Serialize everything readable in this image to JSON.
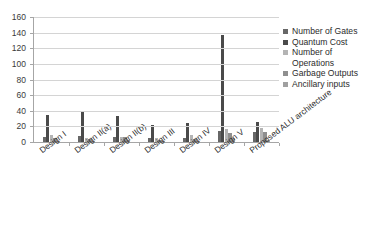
{
  "chart_data": {
    "type": "bar",
    "title": "",
    "xlabel": "",
    "ylabel": "",
    "ylim": [
      0,
      160
    ],
    "ytick_step": 20,
    "yticks": [
      0,
      20,
      40,
      60,
      80,
      100,
      120,
      140,
      160
    ],
    "grid": true,
    "legend_position": "right",
    "categories": [
      "Design I",
      "Design II(a)",
      "Design II(b)",
      "Design III",
      "Design IV",
      "Design V",
      "Proposed ALU architecture"
    ],
    "series": [
      {
        "name": "Number of Gates",
        "color": "#676767",
        "values": [
          7,
          8,
          6,
          5,
          5,
          14,
          13
        ]
      },
      {
        "name": "Quantum Cost",
        "color": "#4a4a4a",
        "values": [
          35,
          40,
          33,
          22,
          24,
          137,
          25
        ]
      },
      {
        "name": "Number of Operations",
        "color": "#b4b4b4",
        "values": [
          9,
          5,
          7,
          5,
          9,
          17,
          18
        ]
      },
      {
        "name": "Garbage Outputs",
        "color": "#8f8f8f",
        "values": [
          5,
          4,
          6,
          3,
          4,
          11,
          13
        ]
      },
      {
        "name": "Ancillary inputs",
        "color": "#a0a0a0",
        "values": [
          1,
          1,
          2,
          1,
          1,
          5,
          3
        ]
      }
    ]
  },
  "legend": {
    "entries": [
      {
        "label": "Number of Gates",
        "swatch_color": "#676767"
      },
      {
        "label": "Quantum Cost",
        "swatch_color": "#4a4a4a"
      },
      {
        "label": "Number of Operations",
        "swatch_color": "#b4b4b4"
      },
      {
        "label": "Garbage Outputs",
        "swatch_color": "#8f8f8f"
      },
      {
        "label": "Ancillary inputs",
        "swatch_color": "#a0a0a0"
      }
    ]
  },
  "axes": {
    "y_tick_labels": [
      "160",
      "140",
      "120",
      "100",
      "80",
      "60",
      "40",
      "20",
      "0"
    ],
    "x_tick_labels": [
      "Design I",
      "Design II(a)",
      "Design II(b)",
      "Design III",
      "Design IV",
      "Design V",
      "Proposed ALU architecture"
    ]
  },
  "style": {
    "background": "#ffffff",
    "gridline_color": "#d4d4d4",
    "axis_color": "#a6a6a6",
    "text_color": "#2b2b2b"
  }
}
